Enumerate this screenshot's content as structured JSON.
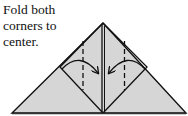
{
  "instruction": {
    "lines": [
      "Fold both",
      "corners to",
      "center."
    ]
  },
  "diagram": {
    "type": "origami-fold-step",
    "colors": {
      "paper": "#d6d6d6",
      "stroke": "#111111",
      "background": "#ffffff"
    },
    "outer_triangle": {
      "apex": [
        103,
        23
      ],
      "bottom_left": [
        12,
        113
      ],
      "bottom_right": [
        186,
        113
      ]
    },
    "inner_square": {
      "top": [
        103,
        23
      ],
      "left": [
        60,
        67
      ],
      "bottom": [
        103,
        113
      ],
      "right": [
        147,
        67
      ]
    },
    "fold_lines": [
      {
        "side": "left",
        "x": 83,
        "y1": 40,
        "y2": 90,
        "style": "dashed"
      },
      {
        "side": "right",
        "x": 124,
        "y1": 40,
        "y2": 90,
        "style": "dashed"
      }
    ],
    "arrows": [
      {
        "side": "left",
        "direction": "toward-center"
      },
      {
        "side": "right",
        "direction": "toward-center"
      }
    ]
  }
}
